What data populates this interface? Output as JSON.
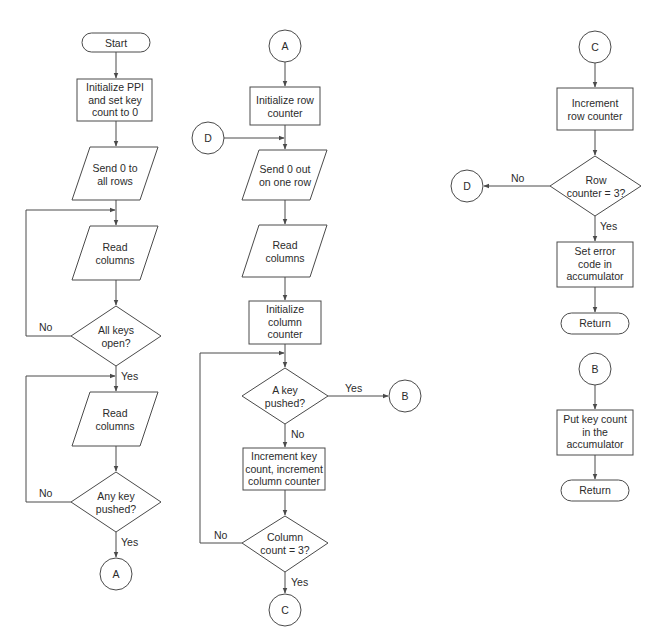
{
  "diagram": {
    "type": "flowchart",
    "columns": [
      {
        "id": "main",
        "nodes": [
          {
            "id": "start",
            "shape": "terminator",
            "text": "Start"
          },
          {
            "id": "init_ppi",
            "shape": "process",
            "text": "Initialize PPI\nand set key\ncount to 0"
          },
          {
            "id": "send0_all",
            "shape": "io",
            "text": "Send 0 to\nall rows"
          },
          {
            "id": "read_cols_1",
            "shape": "io",
            "text": "Read\ncolumns"
          },
          {
            "id": "all_keys_open",
            "shape": "decision",
            "text": "All keys\nopen?"
          },
          {
            "id": "read_cols_2",
            "shape": "io",
            "text": "Read\ncolumns"
          },
          {
            "id": "any_key_pushed",
            "shape": "decision",
            "text": "Any key\npushed?"
          },
          {
            "id": "conn_a_out",
            "shape": "connector",
            "text": "A"
          }
        ]
      },
      {
        "id": "scan",
        "nodes": [
          {
            "id": "conn_a_in",
            "shape": "connector",
            "text": "A"
          },
          {
            "id": "init_row",
            "shape": "process",
            "text": "Initialize row\ncounter"
          },
          {
            "id": "conn_d_in",
            "shape": "connector",
            "text": "D"
          },
          {
            "id": "send0_row",
            "shape": "io",
            "text": "Send 0 out\non one row"
          },
          {
            "id": "read_cols_3",
            "shape": "io",
            "text": "Read\ncolumns"
          },
          {
            "id": "init_col",
            "shape": "process",
            "text": "Initialize\ncolumn\ncounter"
          },
          {
            "id": "a_key_pushed",
            "shape": "decision",
            "text": "A key\npushed?"
          },
          {
            "id": "conn_b_out",
            "shape": "connector",
            "text": "B"
          },
          {
            "id": "inc_key_col",
            "shape": "process",
            "text": "Increment key\ncount, increment\ncolumn counter"
          },
          {
            "id": "col_count_3",
            "shape": "decision",
            "text": "Column\ncount = 3?"
          },
          {
            "id": "conn_c_out",
            "shape": "connector",
            "text": "C"
          }
        ]
      },
      {
        "id": "exits",
        "nodes": [
          {
            "id": "conn_c_in",
            "shape": "connector",
            "text": "C"
          },
          {
            "id": "inc_row",
            "shape": "process",
            "text": "Increment\nrow counter"
          },
          {
            "id": "row_count_3",
            "shape": "decision",
            "text": "Row\ncounter = 3?"
          },
          {
            "id": "conn_d_out",
            "shape": "connector",
            "text": "D"
          },
          {
            "id": "set_error",
            "shape": "process",
            "text": "Set error\ncode in\naccumulator"
          },
          {
            "id": "return_1",
            "shape": "terminator",
            "text": "Return"
          },
          {
            "id": "conn_b_in",
            "shape": "connector",
            "text": "B"
          },
          {
            "id": "put_key_count",
            "shape": "process",
            "text": "Put key count\nin the\naccumulator"
          },
          {
            "id": "return_2",
            "shape": "terminator",
            "text": "Return"
          }
        ]
      }
    ],
    "edge_labels": {
      "all_keys_no": "No",
      "all_keys_yes": "Yes",
      "any_key_no": "No",
      "any_key_yes": "Yes",
      "a_key_yes": "Yes",
      "a_key_no": "No",
      "col_count_no": "No",
      "col_count_yes": "Yes",
      "row_count_no": "No",
      "row_count_yes": "Yes"
    },
    "colors": {
      "stroke": "#4a4a4a",
      "text": "#2b2b2b",
      "background": "#ffffff"
    }
  }
}
